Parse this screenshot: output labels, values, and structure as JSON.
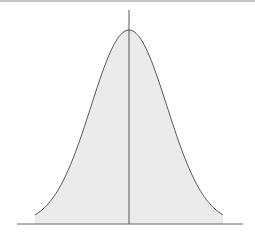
{
  "figure": {
    "colors": {
      "fill": "#ebebeb",
      "curve": "#555555",
      "axis": "#666666",
      "top_rule": "#888888"
    },
    "geometry": {
      "mean_x": 129,
      "sigma_px": 38,
      "baseline_y": 224,
      "peak_y": 30,
      "curve_x_start": 35,
      "curve_x_end": 223,
      "baseline_x_start": 17,
      "baseline_x_end": 243,
      "mean_line_top_y": 10
    }
  }
}
